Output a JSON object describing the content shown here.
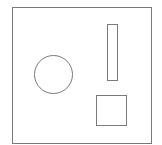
{
  "canvas": {
    "width": 162,
    "height": 145,
    "background": "#ffffff"
  },
  "style": {
    "stroke": "#7a7a7a",
    "stroke_width": 1,
    "fill": "none"
  },
  "shapes": {
    "frame": {
      "type": "rect",
      "x": 12.5,
      "y": 7.5,
      "width": 139,
      "height": 136
    },
    "circle": {
      "type": "circle",
      "cx": 53.5,
      "cy": 74.5,
      "r": 19
    },
    "bar": {
      "type": "rect",
      "x": 107.5,
      "y": 24.5,
      "width": 10,
      "height": 56
    },
    "square": {
      "type": "rect",
      "x": 96.5,
      "y": 95.5,
      "width": 30,
      "height": 30
    }
  }
}
